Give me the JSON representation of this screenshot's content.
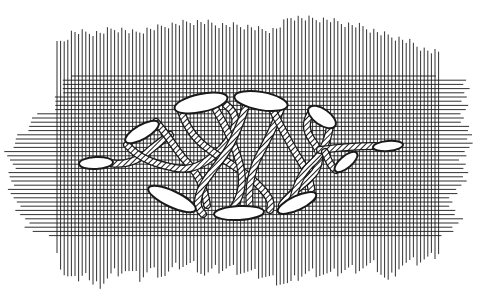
{
  "figure": {
    "title": "",
    "colors": {
      "background": "#ffffff",
      "line": "#1a1a1a",
      "stitch_fill": "#ffffff",
      "thread_fill": "#555555"
    }
  },
  "grid": {
    "vertical": {
      "x_start": 57,
      "x_end": 440,
      "spacing": 3.6,
      "top_profile": [
        [
          57,
          44
        ],
        [
          60,
          42
        ],
        [
          65,
          40
        ],
        [
          72,
          32
        ],
        [
          80,
          32
        ],
        [
          90,
          33
        ],
        [
          100,
          33
        ],
        [
          108,
          30
        ],
        [
          115,
          29
        ],
        [
          125,
          30
        ],
        [
          135,
          33
        ],
        [
          145,
          30
        ],
        [
          160,
          27
        ],
        [
          175,
          24
        ],
        [
          190,
          22
        ],
        [
          205,
          22
        ],
        [
          218,
          25
        ],
        [
          230,
          25
        ],
        [
          250,
          27
        ],
        [
          262,
          30
        ],
        [
          275,
          30
        ],
        [
          290,
          17
        ],
        [
          300,
          18
        ],
        [
          315,
          19
        ],
        [
          330,
          20
        ],
        [
          345,
          24
        ],
        [
          360,
          26
        ],
        [
          380,
          33
        ],
        [
          390,
          36
        ],
        [
          400,
          39
        ],
        [
          410,
          42
        ],
        [
          425,
          50
        ],
        [
          440,
          53
        ]
      ],
      "bottom_profile": [
        [
          57,
          258
        ],
        [
          65,
          275
        ],
        [
          75,
          280
        ],
        [
          85,
          270
        ],
        [
          92,
          288
        ],
        [
          100,
          285
        ],
        [
          115,
          272
        ],
        [
          125,
          270
        ],
        [
          140,
          278
        ],
        [
          150,
          270
        ],
        [
          165,
          275
        ],
        [
          180,
          265
        ],
        [
          195,
          265
        ],
        [
          205,
          275
        ],
        [
          215,
          270
        ],
        [
          230,
          268
        ],
        [
          245,
          272
        ],
        [
          260,
          275
        ],
        [
          275,
          280
        ],
        [
          290,
          285
        ],
        [
          300,
          275
        ],
        [
          315,
          272
        ],
        [
          330,
          275
        ],
        [
          345,
          270
        ],
        [
          360,
          268
        ],
        [
          375,
          265
        ],
        [
          388,
          282
        ],
        [
          400,
          265
        ],
        [
          415,
          262
        ],
        [
          430,
          258
        ],
        [
          440,
          250
        ]
      ]
    },
    "horizontal": {
      "y_start": 76,
      "y_end": 238,
      "spacing": 4.2,
      "left_profile": [
        [
          76,
          75
        ],
        [
          80,
          65
        ],
        [
          90,
          60
        ],
        [
          100,
          57
        ],
        [
          110,
          52
        ],
        [
          116,
          35
        ],
        [
          120,
          33
        ],
        [
          125,
          28
        ],
        [
          130,
          25
        ],
        [
          135,
          20
        ],
        [
          140,
          16
        ],
        [
          145,
          13
        ],
        [
          150,
          8
        ],
        [
          160,
          10
        ],
        [
          170,
          12
        ],
        [
          180,
          10
        ],
        [
          190,
          12
        ],
        [
          200,
          14
        ],
        [
          210,
          18
        ],
        [
          220,
          25
        ],
        [
          230,
          30
        ],
        [
          238,
          57
        ]
      ],
      "right_profile": [
        [
          76,
          440
        ],
        [
          80,
          465
        ],
        [
          90,
          468
        ],
        [
          100,
          462
        ],
        [
          110,
          466
        ],
        [
          120,
          462
        ],
        [
          130,
          470
        ],
        [
          140,
          468
        ],
        [
          150,
          470
        ],
        [
          160,
          462
        ],
        [
          170,
          466
        ],
        [
          180,
          463
        ],
        [
          190,
          460
        ],
        [
          200,
          450
        ],
        [
          210,
          452
        ],
        [
          220,
          460
        ],
        [
          230,
          455
        ],
        [
          238,
          440
        ]
      ]
    }
  },
  "stitches": [
    {
      "id": "stitch-1",
      "cx": 96,
      "cy": 163,
      "rx": 17,
      "ry": 6,
      "rotate": -3
    },
    {
      "id": "stitch-2",
      "cx": 142,
      "cy": 132,
      "rx": 19,
      "ry": 7,
      "rotate": -30
    },
    {
      "id": "stitch-3",
      "cx": 172,
      "cy": 199,
      "rx": 26,
      "ry": 8,
      "rotate": 25
    },
    {
      "id": "stitch-4",
      "cx": 201,
      "cy": 103,
      "rx": 27,
      "ry": 9,
      "rotate": -12
    },
    {
      "id": "stitch-5",
      "cx": 261,
      "cy": 101,
      "rx": 27,
      "ry": 9,
      "rotate": 10
    },
    {
      "id": "stitch-6",
      "cx": 239,
      "cy": 213,
      "rx": 25,
      "ry": 7,
      "rotate": -3
    },
    {
      "id": "stitch-7",
      "cx": 297,
      "cy": 203,
      "rx": 21,
      "ry": 7,
      "rotate": -25
    },
    {
      "id": "stitch-8",
      "cx": 322,
      "cy": 117,
      "rx": 16,
      "ry": 8,
      "rotate": 35
    },
    {
      "id": "stitch-9",
      "cx": 346,
      "cy": 162,
      "rx": 14,
      "ry": 6,
      "rotate": -40
    },
    {
      "id": "stitch-10",
      "cx": 388,
      "cy": 146,
      "rx": 15,
      "ry": 5,
      "rotate": -5
    }
  ],
  "threads": [
    {
      "id": "thread-a",
      "d": "M110,163 C125,166 140,160 150,150 C160,142 165,138 170,135"
    },
    {
      "id": "thread-b",
      "d": "M156,122 C168,135 176,150 185,160 C200,175 205,190 207,205"
    },
    {
      "id": "thread-c",
      "d": "M127,145 C140,160 160,165 175,168 C195,172 210,160 222,148 C238,130 240,115 226,105"
    },
    {
      "id": "thread-d",
      "d": "M180,108 C185,125 195,140 210,150 C230,165 248,172 263,190 C270,198 272,203 270,210"
    },
    {
      "id": "thread-e",
      "d": "M215,108 C225,125 235,145 240,165 C245,185 240,200 230,212"
    },
    {
      "id": "thread-f",
      "d": "M246,106 C240,125 232,145 222,158 C210,175 200,185 198,200 C197,205 199,210 203,214"
    },
    {
      "id": "thread-g",
      "d": "M282,106 C275,125 265,145 258,158 C250,175 248,190 250,210"
    },
    {
      "id": "thread-h",
      "d": "M270,105 C280,125 290,145 300,160 C308,172 312,185 312,198"
    },
    {
      "id": "thread-i",
      "d": "M313,110 C305,120 305,130 312,140 C320,150 322,160 315,172 C305,185 290,192 282,205"
    },
    {
      "id": "thread-j",
      "d": "M330,126 C328,140 322,155 310,165 C300,175 295,188 292,205"
    },
    {
      "id": "thread-k",
      "d": "M320,150 C335,148 350,146 375,146"
    },
    {
      "id": "thread-l",
      "d": "M325,152 C328,160 332,168 336,170"
    }
  ]
}
